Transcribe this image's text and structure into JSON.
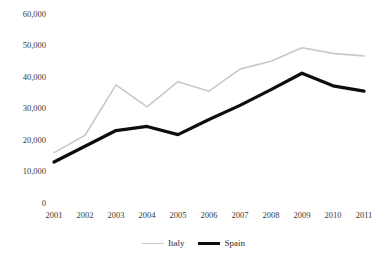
{
  "chart_data": {
    "type": "line",
    "title": "",
    "xlabel": "",
    "ylabel": "",
    "x": [
      "2001",
      "2002",
      "2003",
      "2004",
      "2005",
      "2006",
      "2007",
      "2008",
      "2009",
      "2010",
      "2011"
    ],
    "categories": [
      "2001",
      "2002",
      "2003",
      "2004",
      "2005",
      "2006",
      "2007",
      "2008",
      "2009",
      "2010",
      "2011"
    ],
    "series": [
      {
        "name": "Italy",
        "color": "#c9c9c9",
        "line_width": 1.6,
        "values": [
          16000,
          21500,
          37500,
          30500,
          38500,
          35500,
          42500,
          45000,
          49300,
          47500,
          46700
        ]
      },
      {
        "name": "Spain",
        "color": "#0d0d0d",
        "line_width": 3.2,
        "values": [
          13000,
          18000,
          23000,
          24300,
          21700,
          26500,
          31000,
          36000,
          41200,
          37200,
          35500
        ]
      }
    ],
    "ylim": [
      0,
      60000
    ],
    "xlim": [
      "2001",
      "2011"
    ],
    "y_ticks": [
      0,
      10000,
      20000,
      30000,
      40000,
      50000,
      60000
    ],
    "y_tick_labels": [
      "0",
      "10,000",
      "20,000",
      "30,000",
      "40,000",
      "50,000",
      "60,000"
    ],
    "x_tick_labels": [
      "2001",
      "2002",
      "2003",
      "2004",
      "2005",
      "2006",
      "2007",
      "2008",
      "2009",
      "2010",
      "2011"
    ],
    "grid": false,
    "legend_position": "bottom",
    "legend_entries": [
      "Italy",
      "Spain"
    ]
  },
  "legend": {
    "italy_label": "Italy",
    "spain_label": "Spain"
  },
  "axes": {
    "y_label_0": "0",
    "y_label_10000": "10,000",
    "y_label_20000": "20,000",
    "y_label_30000": "30,000",
    "y_label_40000": "40,000",
    "y_label_50000": "50,000",
    "y_label_60000": "60,000"
  }
}
